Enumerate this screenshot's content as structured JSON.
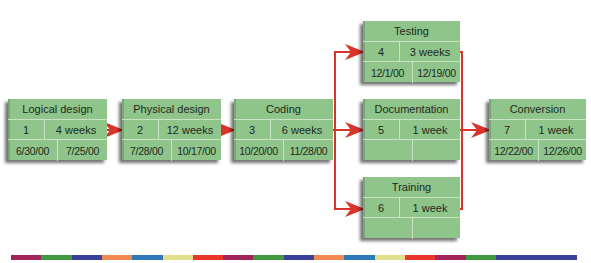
{
  "diagram": {
    "type": "PERT network",
    "nodes": [
      {
        "id": 1,
        "title": "Logical design",
        "num": "1",
        "duration": "4 weeks",
        "start": "6/30/00",
        "end": "7/25/00"
      },
      {
        "id": 2,
        "title": "Physical design",
        "num": "2",
        "duration": "12 weeks",
        "start": "7/28/00",
        "end": "10/17/00"
      },
      {
        "id": 3,
        "title": "Coding",
        "num": "3",
        "duration": "6 weeks",
        "start": "10/20/00",
        "end": "11/28/00"
      },
      {
        "id": 4,
        "title": "Testing",
        "num": "4",
        "duration": "3 weeks",
        "start": "12/1/00",
        "end": "12/19/00"
      },
      {
        "id": 5,
        "title": "Documentation",
        "num": "5",
        "duration": "1 week",
        "start": "",
        "end": ""
      },
      {
        "id": 6,
        "title": "Training",
        "num": "6",
        "duration": "1 week",
        "start": "",
        "end": ""
      },
      {
        "id": 7,
        "title": "Conversion",
        "num": "7",
        "duration": "1 week",
        "start": "12/22/00",
        "end": "12/26/00"
      }
    ],
    "edges": [
      [
        1,
        2
      ],
      [
        2,
        3
      ],
      [
        3,
        4
      ],
      [
        3,
        5
      ],
      [
        3,
        6
      ],
      [
        4,
        7
      ],
      [
        5,
        7
      ],
      [
        6,
        7
      ]
    ],
    "colors": {
      "node_fill": "#8fc48b",
      "arrow": "#d9342b"
    },
    "color_bar": [
      "#a3245a",
      "#3f9a3f",
      "#3a3f9c",
      "#f08a52",
      "#2e78b8",
      "#e2e08a",
      "#e8382a",
      "#a3245a",
      "#3f9a3f",
      "#3a3f9c",
      "#f08a52",
      "#2e78b8",
      "#e2e08a",
      "#e8382a",
      "#a3245a",
      "#3f9a3f",
      "#3a3f9c"
    ]
  }
}
